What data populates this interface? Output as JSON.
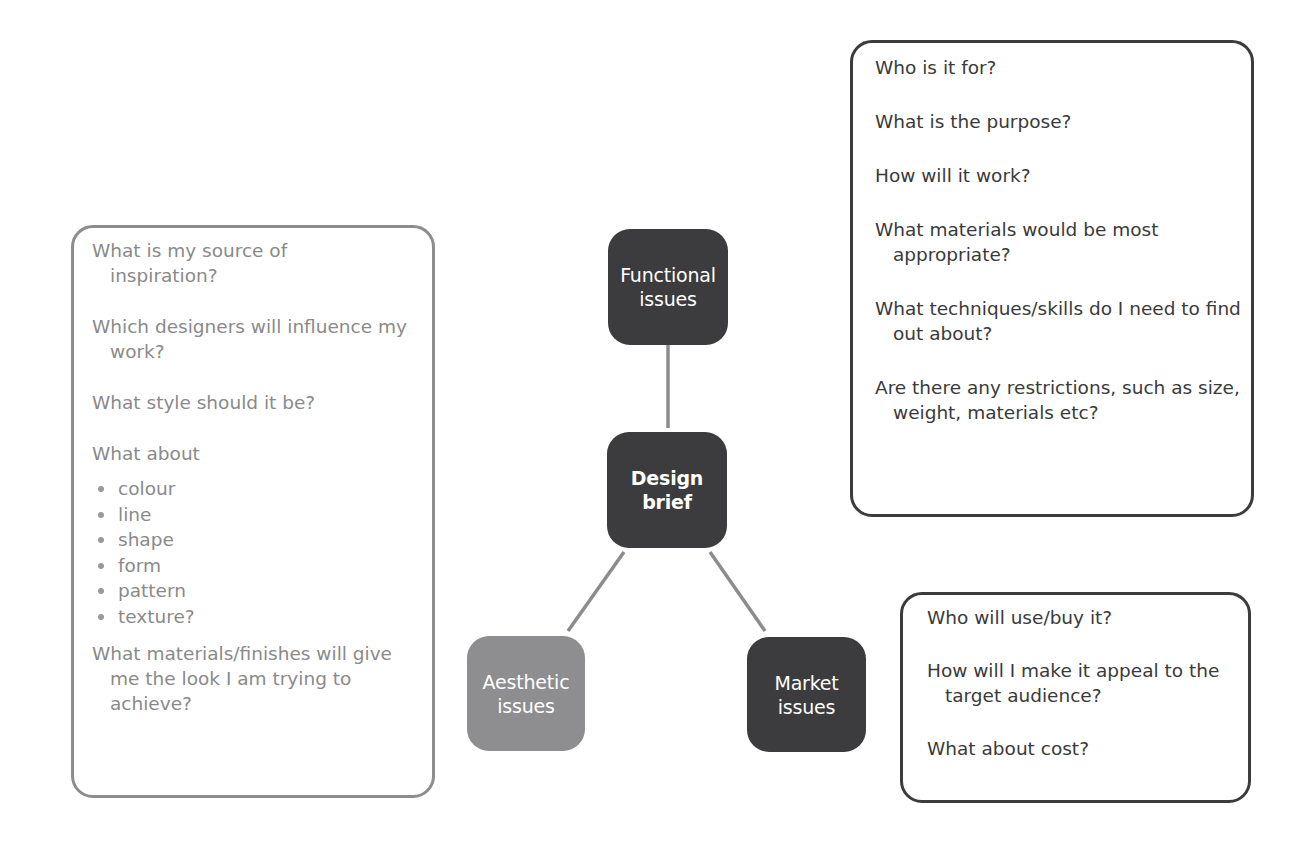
{
  "diagram": {
    "type": "mind-map",
    "center": {
      "label_line1": "Design",
      "label_line2": "brief"
    },
    "nodes": {
      "functional": {
        "label_line1": "Functional",
        "label_line2": "issues"
      },
      "aesthetic": {
        "label_line1": "Aesthetic",
        "label_line2": "issues"
      },
      "market": {
        "label_line1": "Market",
        "label_line2": "issues"
      }
    },
    "functional_questions": [
      "Who is it for?",
      "What is the purpose?",
      "How will it work?",
      "What materials would be most appropriate?",
      "What techniques/skills do I need to find out about?",
      "Are there any restrictions, such as size, weight, materials etc?"
    ],
    "aesthetic_questions": {
      "q1": "What is my source of inspiration?",
      "q2": "Which designers will influence my work?",
      "q3": "What style should it be?",
      "q4": "What about",
      "bullets": [
        "colour",
        "line",
        "shape",
        "form",
        "pattern",
        "texture?"
      ],
      "q5": "What materials/finishes will give me the look I am trying to achieve?"
    },
    "market_questions": [
      "Who will use/buy it?",
      "How will I make it appeal to the target audience?",
      "What about cost?"
    ],
    "colors": {
      "dark_node": "#3c3b3d",
      "light_node": "#8e8d8f",
      "connector": "#8c8c8c",
      "dark_border": "#3c3c3c",
      "grey_border": "#8d8d8d",
      "dark_text": "#3a3a3a",
      "grey_text": "#8a8a8a"
    }
  }
}
